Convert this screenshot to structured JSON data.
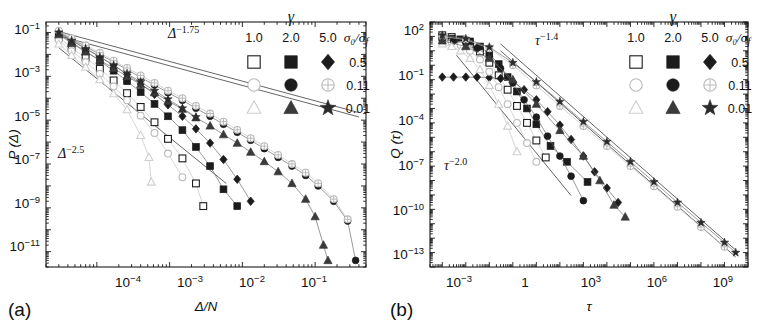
{
  "figure": {
    "panels": [
      {
        "tag": "(a)",
        "xlabel": "Δ/N",
        "ylabel": "P (Δ)",
        "annotations": [
          {
            "text": "Δ",
            "exp": "−1.75"
          },
          {
            "text": "Δ",
            "exp": "−2.5"
          }
        ],
        "xticks": [
          {
            "mant": "10",
            "exp": "−4"
          },
          {
            "mant": "10",
            "exp": "−3"
          },
          {
            "mant": "10",
            "exp": "−2"
          },
          {
            "mant": "10",
            "exp": "−1"
          }
        ],
        "yticks": [
          {
            "mant": "10",
            "exp": "−1"
          },
          {
            "mant": "10",
            "exp": "−3"
          },
          {
            "mant": "10",
            "exp": "−5"
          },
          {
            "mant": "10",
            "exp": "−7"
          },
          {
            "mant": "10",
            "exp": "−9"
          },
          {
            "mant": "10",
            "exp": "−11"
          }
        ]
      },
      {
        "tag": "(b)",
        "xlabel": "τ",
        "ylabel": "Q (τ)",
        "annotations": [
          {
            "text": "τ",
            "exp": "−1.4"
          },
          {
            "text": "τ",
            "exp": "−2.0"
          }
        ],
        "xticks": [
          {
            "mant": "10",
            "exp": "−3"
          },
          {
            "mant": "1",
            "exp": ""
          },
          {
            "mant": "10",
            "exp": "3"
          },
          {
            "mant": "10",
            "exp": "6"
          },
          {
            "mant": "10",
            "exp": "9"
          }
        ],
        "yticks": [
          {
            "mant": "10",
            "exp": "2"
          },
          {
            "mant": "10",
            "exp": "−1"
          },
          {
            "mant": "10",
            "exp": "−4"
          },
          {
            "mant": "10",
            "exp": "−7"
          },
          {
            "mant": "10",
            "exp": "−10"
          },
          {
            "mant": "10",
            "exp": "−13"
          }
        ]
      }
    ],
    "legend": {
      "group_header": "γ",
      "columns": [
        "1.0",
        "2.0",
        "5.0"
      ],
      "row_header": "σ₀/σ",
      "row_header_sub": "f",
      "rows": [
        {
          "label": "0.5",
          "markers": [
            "open-square",
            "filled-square",
            "filled-diamond"
          ]
        },
        {
          "label": "0.11",
          "markers": [
            "open-circle",
            "filled-circle",
            "crossed-circle"
          ]
        },
        {
          "label": "0.01",
          "markers": [
            "open-triangle",
            "filled-triangle",
            "filled-star"
          ]
        }
      ]
    }
  },
  "chart_data": [
    {
      "type": "scatter",
      "panel": "(a)",
      "title": "",
      "xlabel": "Δ/N",
      "ylabel": "P (Δ)",
      "xscale": "log",
      "yscale": "log",
      "xlim": [
        2e-05,
        0.5
      ],
      "ylim": [
        2e-12,
        0.3
      ],
      "grid": false,
      "legend_position": "top-right",
      "annotations": [
        {
          "label": "Δ^−1.75",
          "slope": -1.75
        },
        {
          "label": "Δ^−2.5",
          "slope": -2.5
        }
      ],
      "guide_lines": [
        {
          "slope": -1.75,
          "x0": 3e-05,
          "y0": 0.11,
          "x1": 0.4,
          "y1": 2.2e-05
        },
        {
          "slope": -1.75,
          "x0": 3e-05,
          "y0": 0.07,
          "x1": 0.4,
          "y1": 1.4e-05
        },
        {
          "slope": -2.5,
          "x0": 3e-05,
          "y0": 0.02,
          "x1": 0.006,
          "y1": 1.3e-08
        }
      ],
      "series": [
        {
          "name": "γ=1.0, σ₀/σf=0.5",
          "marker": "open-square",
          "x": [
            3e-05,
            4.5e-05,
            7e-05,
            0.00011,
            0.00017,
            0.00026,
            0.0004,
            0.00062,
            0.00095,
            0.0015,
            0.0023,
            0.0029
          ],
          "y": [
            0.06,
            0.02,
            0.007,
            0.0022,
            0.00065,
            0.00017,
            4e-05,
            8e-06,
            1.4e-06,
            1.8e-07,
            1.3e-08,
            1.2e-09
          ]
        },
        {
          "name": "γ=2.0, σ₀/σf=0.5",
          "marker": "filled-square",
          "x": [
            3e-05,
            4.5e-05,
            7e-05,
            0.00011,
            0.00017,
            0.00026,
            0.0004,
            0.00062,
            0.00095,
            0.0015,
            0.0023,
            0.0036,
            0.0055,
            0.0085
          ],
          "y": [
            0.09,
            0.035,
            0.014,
            0.005,
            0.0018,
            0.0006,
            0.00019,
            5.5e-05,
            1.5e-05,
            3.5e-06,
            6e-07,
            8e-08,
            7e-09,
            1.2e-09
          ]
        },
        {
          "name": "γ=5.0, σ₀/σf=0.5",
          "marker": "filled-diamond",
          "x": [
            3e-05,
            4.5e-05,
            7e-05,
            0.00011,
            0.00017,
            0.00026,
            0.0004,
            0.00062,
            0.00095,
            0.0015,
            0.0023,
            0.0036,
            0.0055,
            0.0085,
            0.013
          ],
          "y": [
            0.1,
            0.045,
            0.019,
            0.008,
            0.0032,
            0.0012,
            0.00045,
            0.00015,
            5e-05,
            1.5e-05,
            4e-06,
            9e-07,
            1.6e-07,
            2e-08,
            2e-09
          ]
        },
        {
          "name": "γ=1.0, σ₀/σf=0.11",
          "marker": "open-circle",
          "x": [
            3e-05,
            4.5e-05,
            7e-05,
            0.00011,
            0.00017,
            0.00026,
            0.0004,
            0.00062,
            0.00095,
            0.0015
          ],
          "y": [
            0.045,
            0.014,
            0.0045,
            0.0013,
            0.00035,
            8e-05,
            1.6e-05,
            2.6e-06,
            3e-07,
            2.5e-08
          ]
        },
        {
          "name": "γ=2.0, σ₀/σf=0.11",
          "marker": "filled-circle",
          "x": [
            3e-05,
            4.5e-05,
            7e-05,
            0.00011,
            0.00017,
            0.00026,
            0.0004,
            0.00062,
            0.00095,
            0.0015,
            0.0023,
            0.0036,
            0.0055,
            0.0085,
            0.013,
            0.02,
            0.031,
            0.048,
            0.074,
            0.11,
            0.18,
            0.28,
            0.36
          ],
          "y": [
            0.11,
            0.05,
            0.023,
            0.01,
            0.0045,
            0.002,
            0.0009,
            0.0004,
            0.00018,
            8e-05,
            3.5e-05,
            1.5e-05,
            6.5e-06,
            2.8e-06,
            1.2e-06,
            5e-07,
            2e-07,
            8e-08,
            3e-08,
            1e-08,
            2e-09,
            2.5e-10,
            4e-12
          ]
        },
        {
          "name": "γ=5.0, σ₀/σf=0.11",
          "marker": "crossed-circle",
          "x": [
            3e-05,
            4.5e-05,
            7e-05,
            0.00011,
            0.00017,
            0.00026,
            0.0004,
            0.00062,
            0.00095,
            0.0015,
            0.0023,
            0.0036,
            0.0055,
            0.0085,
            0.013,
            0.02,
            0.031,
            0.048,
            0.074,
            0.11,
            0.18,
            0.28
          ],
          "y": [
            0.12,
            0.055,
            0.026,
            0.012,
            0.0052,
            0.0024,
            0.0011,
            0.0005,
            0.00022,
            0.0001,
            4.5e-05,
            2e-05,
            8.5e-06,
            3.6e-06,
            1.5e-06,
            6.5e-07,
            2.6e-07,
            1e-07,
            4e-08,
            1.3e-08,
            2.5e-09,
            3e-10
          ]
        },
        {
          "name": "γ=1.0, σ₀/σf=0.01",
          "marker": "open-triangle",
          "x": [
            3e-05,
            4.5e-05,
            7e-05,
            0.00011,
            0.00017,
            0.00026,
            0.0004,
            0.00052,
            0.00056
          ],
          "y": [
            0.03,
            0.009,
            0.0026,
            0.0007,
            0.00016,
            3e-05,
            2e-06,
            2e-07,
            1.5e-08
          ]
        },
        {
          "name": "γ=2.0, σ₀/σf=0.01",
          "marker": "filled-triangle",
          "x": [
            3e-05,
            4.5e-05,
            7e-05,
            0.00011,
            0.00017,
            0.00026,
            0.0004,
            0.00062,
            0.00095,
            0.0015,
            0.0023,
            0.0036,
            0.0055,
            0.0085,
            0.013,
            0.02,
            0.031,
            0.048,
            0.074,
            0.1,
            0.13,
            0.15
          ],
          "y": [
            0.08,
            0.032,
            0.013,
            0.0055,
            0.0023,
            0.001,
            0.00042,
            0.00018,
            7.5e-05,
            3.2e-05,
            1.3e-05,
            5.5e-06,
            2.2e-06,
            9e-07,
            3.5e-07,
            1.3e-07,
            4.5e-08,
            1.3e-08,
            2.5e-09,
            4e-10,
            2e-11,
            4e-12
          ]
        },
        {
          "name": "γ=5.0, σ₀/σf=0.01",
          "marker": "filled-star",
          "x": [
            3e-05,
            4.5e-05,
            7e-05,
            0.00011,
            0.00017,
            0.00026,
            0.0004,
            0.00062,
            0.00095,
            0.0015,
            0.0023
          ],
          "y": [
            0.1,
            0.042,
            0.018,
            0.0075,
            0.0032,
            0.0013,
            0.00055,
            0.00022,
            9e-05,
            3.5e-05,
            1.4e-05
          ]
        }
      ]
    },
    {
      "type": "scatter",
      "panel": "(b)",
      "title": "",
      "xlabel": "τ",
      "ylabel": "Q (τ)",
      "xscale": "log",
      "yscale": "log",
      "xlim": [
        0.0003,
        10000000000.0
      ],
      "ylim": [
        1e-14,
        1000.0
      ],
      "grid": false,
      "legend_position": "top-right",
      "annotations": [
        {
          "label": "τ^−1.4",
          "slope": -1.4
        },
        {
          "label": "τ^−2.0",
          "slope": -2.0
        }
      ],
      "guide_lines": [
        {
          "slope": -1.4,
          "x0": 0.3,
          "y0": 30.0,
          "x1": 3000000000.0,
          "y1": 1.5e-13
        },
        {
          "slope": -1.4,
          "x0": 0.3,
          "y0": 10.0,
          "x1": 3000000000.0,
          "y1": 5e-14
        },
        {
          "slope": -2.0,
          "x0": 0.004,
          "y0": 5.0,
          "x1": 300.0,
          "y1": 9e-10
        }
      ],
      "series": [
        {
          "name": "γ=1.0, σ₀/σf=0.5",
          "marker": "open-square",
          "x": [
            0.001,
            0.0025,
            0.006,
            0.015,
            0.04,
            0.1,
            0.25,
            0.6,
            1.5,
            4.0,
            10.0,
            25.0
          ],
          "y": [
            120.0,
            90.0,
            60.0,
            30.0,
            9.0,
            1.5,
            0.2,
            0.02,
            0.0015,
            0.0001,
            6e-06,
            4e-07
          ]
        },
        {
          "name": "γ=2.0, σ₀/σf=0.5",
          "marker": "filled-square",
          "x": [
            0.001,
            0.0025,
            0.006,
            0.015,
            0.04,
            0.1,
            0.25,
            0.6,
            1.5,
            4.0,
            10.0,
            40.0,
            200.0,
            1500.0
          ],
          "y": [
            80.0,
            70.0,
            60.0,
            45.0,
            20.0,
            6.0,
            1.2,
            0.15,
            0.015,
            0.001,
            8e-05,
            2.5e-06,
            2e-07,
            8e-09
          ]
        },
        {
          "name": "γ=5.0, σ₀/σf=0.5",
          "marker": "filled-diamond",
          "x": [
            0.001,
            0.003,
            0.01,
            0.03,
            0.1,
            0.3,
            1.0,
            3.0,
            10.0,
            30.0,
            100.0,
            300.0,
            1000.0,
            3000.0,
            10000.0,
            30000.0
          ],
          "y": [
            0.15,
            0.15,
            0.15,
            0.15,
            0.14,
            0.12,
            0.07,
            0.02,
            0.004,
            0.0006,
            7e-05,
            7e-06,
            5e-07,
            4e-08,
            3e-09,
            3e-10
          ]
        },
        {
          "name": "γ=1.0, σ₀/σf=0.11",
          "marker": "open-circle",
          "x": [
            0.001,
            0.0025,
            0.006,
            0.015,
            0.04,
            0.1,
            0.25,
            0.6,
            1.5,
            4.0,
            10.0
          ],
          "y": [
            50.0,
            40.0,
            25.0,
            10.0,
            2.5,
            0.35,
            0.03,
            0.002,
            0.0001,
            4e-06,
            2e-07
          ]
        },
        {
          "name": "γ=2.0, σ₀/σf=0.11",
          "marker": "filled-circle",
          "x": [
            0.001,
            0.003,
            0.01,
            0.03,
            0.1,
            0.3,
            1.0,
            3.0,
            10.0,
            30.0,
            100.0,
            300.0,
            1000.0
          ],
          "y": [
            60.0,
            50.0,
            35.0,
            15.0,
            4.0,
            0.6,
            0.06,
            0.004,
            0.00025,
            1.2e-05,
            5e-07,
            2e-08,
            4e-10
          ]
        },
        {
          "name": "γ=5.0, σ₀/σf=0.11",
          "marker": "crossed-circle",
          "x": [
            0.001,
            0.01,
            0.1,
            1.0,
            10.0,
            100.0,
            1000.0,
            10000.0,
            100000.0,
            1000000.0,
            10000000.0,
            100000000.0,
            1000000000.0
          ],
          "y": [
            100.0,
            60.0,
            15.0,
            1.0,
            0.04,
            0.0015,
            6e-05,
            2.5e-06,
            1e-07,
            4e-09,
            1.5e-10,
            6e-12,
            2.5e-13
          ]
        },
        {
          "name": "γ=1.0, σ₀/σf=0.01",
          "marker": "open-triangle",
          "x": [
            0.001,
            0.0025,
            0.006,
            0.015,
            0.04,
            0.1,
            0.25,
            0.6,
            1.5
          ],
          "y": [
            30.0,
            20.0,
            10.0,
            3.0,
            0.5,
            0.04,
            0.002,
            6e-05,
            1e-06
          ]
        },
        {
          "name": "γ=2.0, σ₀/σf=0.01",
          "marker": "filled-triangle",
          "x": [
            0.001,
            0.01,
            0.1,
            1.0,
            10.0,
            100.0,
            1000.0,
            5000.0,
            20000.0,
            60000.0
          ],
          "y": [
            50.0,
            20.0,
            3.0,
            0.1,
            0.002,
            3e-05,
            5e-07,
            1e-08,
            2e-10,
            3e-11
          ]
        },
        {
          "name": "γ=5.0, σ₀/σf=0.01",
          "marker": "filled-star",
          "x": [
            0.001,
            0.01,
            0.1,
            1.0,
            10.0,
            100.0,
            1000.0,
            10000.0,
            100000.0,
            1000000.0,
            10000000.0,
            100000000.0,
            1000000000.0,
            3000000000.0
          ],
          "y": [
            120.0,
            70.0,
            18.0,
            1.5,
            0.07,
            0.003,
            0.00012,
            5e-06,
            2e-07,
            8e-09,
            3e-10,
            1.2e-11,
            5e-13,
            1e-13
          ]
        }
      ]
    }
  ]
}
